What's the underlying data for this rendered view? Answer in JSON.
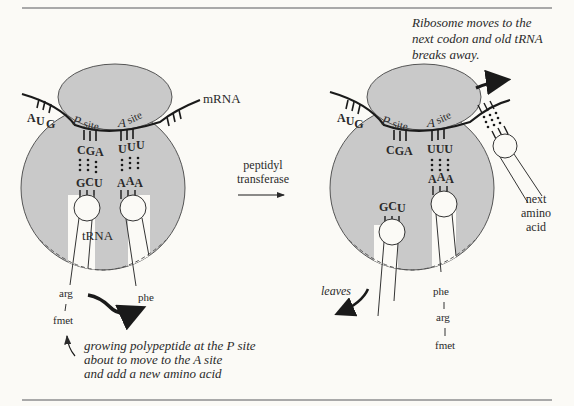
{
  "colors": {
    "background": "#fbfaf6",
    "ribosome_fill": "#c9c9c9",
    "ribosome_stroke": "#555555",
    "rule": "#a9a9a9",
    "ink": "#2a2a2a"
  },
  "left_panel": {
    "mrna_label": "mRNA",
    "codons": {
      "start": [
        "A",
        "U",
        "G"
      ],
      "p_site": [
        "C",
        "G",
        "A"
      ],
      "a_site": [
        "U",
        "U",
        "U"
      ]
    },
    "p_site_label_p": "P",
    "p_site_label_site": "site",
    "a_site_label_a": "A",
    "a_site_label_site": "site",
    "p_anticodon": [
      "G",
      "C",
      "U"
    ],
    "a_anticodon": [
      "A",
      "A",
      "A"
    ],
    "trna_label": "tRNA",
    "p_chain": [
      "arg",
      "fmet"
    ],
    "a_amino": "phe",
    "caption_lines": [
      "growing polypeptide at the P site",
      "about to move to the A site",
      "and add a new amino acid"
    ]
  },
  "middle": {
    "enzyme_line1": "peptidyl",
    "enzyme_line2": "transferase"
  },
  "right_panel": {
    "caption_lines": [
      "Ribosome moves to the",
      "next codon and old tRNA",
      "breaks away."
    ],
    "codons": {
      "start": [
        "A",
        "U",
        "G"
      ],
      "p_site": [
        "C",
        "G",
        "A"
      ],
      "a_site": [
        "U",
        "U",
        "U"
      ]
    },
    "p_site_label_p": "P",
    "p_site_label_site": "site",
    "a_site_label_a": "A",
    "a_site_label_site": "site",
    "leaving_anticodon": [
      "G",
      "C",
      "U"
    ],
    "a_anticodon": [
      "A",
      "A",
      "A"
    ],
    "leaves_label": "leaves",
    "chain": [
      "phe",
      "arg",
      "fmet"
    ],
    "next_label_lines": [
      "next",
      "amino",
      "acid"
    ]
  }
}
